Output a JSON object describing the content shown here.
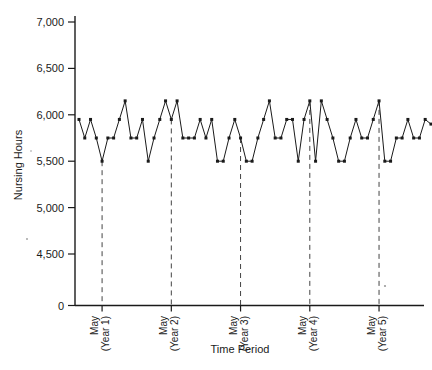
{
  "chart_data": {
    "type": "line",
    "title": "",
    "xlabel": "Time Period",
    "ylabel": "Nursing Hours",
    "ylim": [
      4400,
      7000
    ],
    "ytick_labels": [
      "0",
      "4,500",
      "5,000",
      "5,500",
      "6,000",
      "6,500",
      "7,000"
    ],
    "ytick_values": [
      0,
      4500,
      5000,
      5500,
      6000,
      6500,
      7000
    ],
    "axis_break": true,
    "axis_break_note": "y-axis is broken between 0 and 4,500",
    "grid": false,
    "legend": "none",
    "markers": "filled-square",
    "reference_lines": [
      {
        "label_line1": "May",
        "label_line2": "(Year 1)",
        "x_index": 4
      },
      {
        "label_line1": "May",
        "label_line2": "(Year 2)",
        "x_index": 16
      },
      {
        "label_line1": "May",
        "label_line2": "(Year 3)",
        "x_index": 28
      },
      {
        "label_line1": "May",
        "label_line2": "(Year 4)",
        "x_index": 40
      },
      {
        "label_line1": "May",
        "label_line2": "(Year 5)",
        "x_index": 52
      }
    ],
    "x": [
      0,
      1,
      2,
      3,
      4,
      5,
      6,
      7,
      8,
      9,
      10,
      11,
      12,
      13,
      14,
      15,
      16,
      17,
      18,
      19,
      20,
      21,
      22,
      23,
      24,
      25,
      26,
      27,
      28,
      29,
      30,
      31,
      32,
      33,
      34,
      35,
      36,
      37,
      38,
      39,
      40,
      41,
      42,
      43,
      44,
      45,
      46,
      47,
      48,
      49,
      50,
      51,
      52,
      53,
      54,
      55,
      56,
      57,
      58,
      59,
      60,
      61
    ],
    "values": [
      5950,
      5750,
      5950,
      5750,
      5500,
      5750,
      5750,
      5950,
      6150,
      5750,
      5750,
      5950,
      5500,
      5750,
      5950,
      6150,
      5950,
      6150,
      5750,
      5750,
      5750,
      5950,
      5750,
      5950,
      5500,
      5500,
      5750,
      5950,
      5750,
      5500,
      5500,
      5750,
      5950,
      6150,
      5750,
      5750,
      5950,
      5950,
      5500,
      5950,
      6150,
      5500,
      6150,
      5950,
      5750,
      5500,
      5500,
      5750,
      5950,
      5750,
      5750,
      5950,
      6150,
      5500,
      5500,
      5750,
      5750,
      5950,
      5750,
      5750,
      5950,
      5900
    ]
  },
  "axes": {
    "y_title": "Nursing Hours",
    "x_title": "Time Period"
  }
}
